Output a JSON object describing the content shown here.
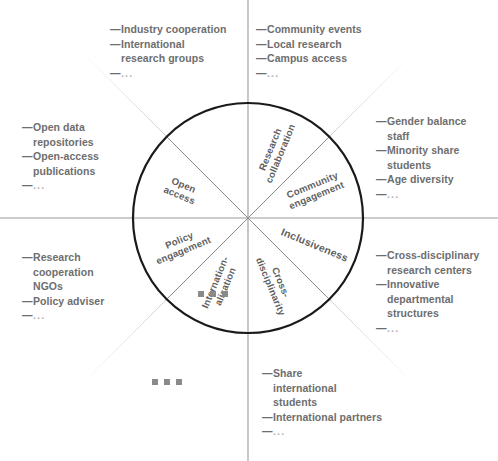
{
  "diagram": {
    "circle": {
      "center_x": 248,
      "center_y": 218,
      "radius": 115,
      "stroke_color": "#1a1a1a",
      "stroke_width": 2.2
    },
    "axis_color": "#9a9a9a",
    "spoke_color": "#8e8e8e",
    "ray_color": "#c9c9c9",
    "text_color": "#6e6e6e",
    "segments": [
      {
        "id": "research-collaboration",
        "label": "Research\ncollaboration",
        "angle_deg": -67.5
      },
      {
        "id": "community-engagement",
        "label": "Community\nengagement",
        "angle_deg": -22.5
      },
      {
        "id": "inclusiveness",
        "label": "Inclusiveness",
        "angle_deg": 22.5
      },
      {
        "id": "cross-disciplinarity",
        "label": "Cross-\ndisciplinarity",
        "angle_deg": 67.5
      },
      {
        "id": "internationalization",
        "label": "Internation-\nalization",
        "angle_deg": 112.5
      },
      {
        "id": "policy-engagement",
        "label": "Policy\nengagement",
        "angle_deg": 157.5
      },
      {
        "id": "open-access",
        "label": "Open\naccess",
        "angle_deg": 202.5
      },
      {
        "id": "more-indicators",
        "label": "▪ ▪ ▪",
        "angle_deg": 247.5
      }
    ],
    "annotations": [
      {
        "id": "research-collaboration-indicators",
        "for_segment": "research-collaboration",
        "items": [
          "Industry cooperation",
          "International\nresearch groups",
          "..."
        ]
      },
      {
        "id": "community-engagement-indicators",
        "for_segment": "community-engagement",
        "items": [
          "Community events",
          "Local research",
          "Campus access",
          "..."
        ]
      },
      {
        "id": "inclusiveness-indicators",
        "for_segment": "inclusiveness",
        "items": [
          "Gender balance\nstaff",
          "Minority share\nstudents",
          "Age diversity",
          "..."
        ]
      },
      {
        "id": "cross-disciplinarity-indicators",
        "for_segment": "cross-disciplinarity",
        "items": [
          "Cross-disciplinary\nresearch centers",
          "Innovative\ndepartmental\nstructures",
          "..."
        ]
      },
      {
        "id": "internationalization-indicators",
        "for_segment": "internationalization",
        "items": [
          "Share\ninternational\nstudents",
          "International partners",
          "..."
        ]
      },
      {
        "id": "policy-engagement-indicators",
        "for_segment": "policy-engagement",
        "items": [
          "Research\ncooperation\nNGOs",
          "Policy adviser",
          "..."
        ]
      },
      {
        "id": "open-access-indicators",
        "for_segment": "open-access",
        "items": [
          "Open data\nrepositories",
          "Open-access\npublications",
          "..."
        ]
      }
    ],
    "ellipsis_marks": [
      {
        "id": "inner-ellipsis-mark",
        "x": 198,
        "y": 291
      },
      {
        "id": "outer-ellipsis-mark",
        "x": 152,
        "y": 379
      }
    ],
    "dash_glyph": "—",
    "ellipsis_glyph": "..."
  }
}
